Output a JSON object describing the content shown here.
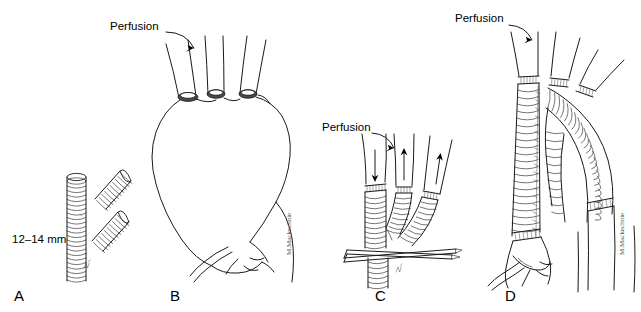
{
  "figure": {
    "background_color": "#ffffff",
    "ink_color": "#1a1a1a",
    "width": 641,
    "height": 312
  },
  "panels": [
    {
      "id": "A",
      "letter": "A",
      "letter_x": 14,
      "letter_y": 301,
      "caption": "Trifurcated graft limbs",
      "measurement_label": "12–14 mm",
      "measurement_x": 12,
      "measurement_y": 243,
      "graft_count": 3
    },
    {
      "id": "B",
      "letter": "B",
      "letter_x": 170,
      "letter_y": 301,
      "caption": "Aortic arch aneurysm with transected brachiocephalic vessels",
      "perfusion_label": "Perfusion",
      "perfusion_x": 110,
      "perfusion_y": 30,
      "branch_vessel_count": 3
    },
    {
      "id": "C",
      "letter": "C",
      "letter_x": 375,
      "letter_y": 301,
      "caption": "Trifurcated graft anastomosed to head vessels with antegrade perfusion",
      "perfusion_label": "Perfusion",
      "perfusion_x": 322,
      "perfusion_y": 131,
      "flow_arrows": [
        {
          "name": "inflow-down-arrow",
          "direction": "down"
        },
        {
          "name": "outflow-up-arrow-middle",
          "direction": "up"
        },
        {
          "name": "outflow-up-arrow-right",
          "direction": "up"
        }
      ],
      "clamp_present": true
    },
    {
      "id": "D",
      "letter": "D",
      "letter_x": 505,
      "letter_y": 301,
      "caption": "Completed arch replacement with corrugated arch graft",
      "perfusion_label": "Perfusion",
      "perfusion_x": 455,
      "perfusion_y": 22,
      "branch_vessel_count": 3
    }
  ],
  "signatures": [
    {
      "name": "artist-signature-b",
      "x": 291,
      "y": 255
    },
    {
      "name": "artist-signature-d",
      "x": 624,
      "y": 255
    }
  ]
}
